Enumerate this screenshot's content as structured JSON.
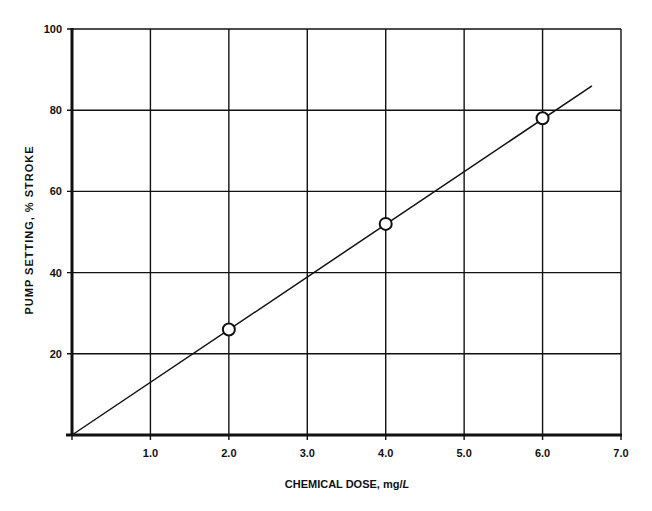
{
  "chart_data": {
    "type": "line",
    "title": "",
    "xlabel": "CHEMICAL DOSE, mg/L",
    "xlabel_parts": [
      "CHEMICAL DOSE, mg/",
      "L"
    ],
    "ylabel": "PUMP SETTING, % STROKE",
    "xlim": [
      0,
      7.0
    ],
    "ylim": [
      0,
      100
    ],
    "x_ticks": [
      1.0,
      2.0,
      3.0,
      4.0,
      5.0,
      6.0,
      7.0
    ],
    "x_tick_labels": [
      "1.0",
      "2.0",
      "3.0",
      "4.0",
      "5.0",
      "6.0",
      "7.0"
    ],
    "y_ticks": [
      20,
      40,
      60,
      80,
      100
    ],
    "y_tick_labels": [
      "20",
      "40",
      "60",
      "80",
      "100"
    ],
    "grid": true,
    "legend": null,
    "series": [
      {
        "name": "Data points",
        "marker": "open-circle",
        "x": [
          2.0,
          4.0,
          6.0
        ],
        "y": [
          26,
          52,
          78
        ]
      },
      {
        "name": "Best-fit line",
        "marker": "none",
        "x": [
          0,
          6.63
        ],
        "y": [
          0,
          86
        ]
      }
    ]
  },
  "colors": {
    "ink": "#111111",
    "background": "#ffffff"
  }
}
